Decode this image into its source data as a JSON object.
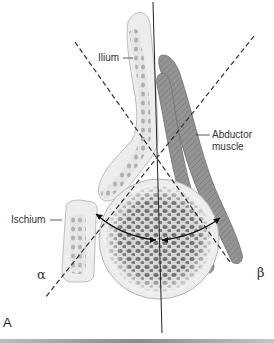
{
  "figure": {
    "panel_label": "A",
    "labels": {
      "ilium": "Ilium",
      "ischium": "Ischium",
      "abductor_line1": "Abductor",
      "abductor_line2": "muscle",
      "alpha": "α",
      "beta": "β"
    },
    "colors": {
      "bone_fill": "#ececec",
      "bone_outline": "#b8b8b8",
      "trabecula": "#6d6d6d",
      "muscle_fill": "#8f8f8f",
      "muscle_outline": "#6a6a6a",
      "line": "#222222",
      "dash": "#333333"
    },
    "structures": [
      "ilium",
      "ischium",
      "femoral head",
      "abductor muscle",
      "vertical reference line",
      "alpha line",
      "beta line",
      "angle arrows"
    ]
  }
}
